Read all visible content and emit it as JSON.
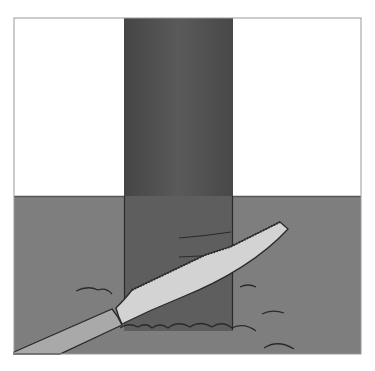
{
  "illustration": {
    "title": "Saw cutting a post at ground level",
    "colors": {
      "background": "#ffffff",
      "sky": "#ffffff",
      "frame": "#9a9a9a",
      "ground": "#7d7d7d",
      "post": "#4e4e4e",
      "post_below_ground": "#5c5c5c",
      "blade": "#d2d2d2",
      "handle": "#a8a8a8",
      "outline": "#2a2a2a"
    },
    "frame": {
      "x": 14,
      "y": 18,
      "width": 347,
      "height": 336
    },
    "ground_line_y": 196,
    "post": {
      "x": 124,
      "width": 109
    }
  }
}
